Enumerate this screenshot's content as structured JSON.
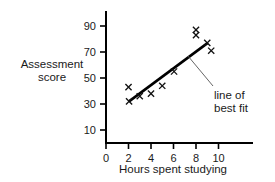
{
  "chart_data": {
    "type": "scatter",
    "title": "",
    "xlabel": "Hours spent studying",
    "ylabel_line1": "Assessment",
    "ylabel_line2": "score",
    "xlim": [
      0,
      11
    ],
    "ylim": [
      0,
      95
    ],
    "xticks": [
      0,
      2,
      4,
      6,
      8,
      10
    ],
    "xtick_labels": [
      "0",
      "2",
      "4",
      "6",
      "8",
      "10"
    ],
    "yticks": [
      10,
      30,
      50,
      70,
      90
    ],
    "ytick_labels": [
      "10",
      "30",
      "50",
      "70",
      "90"
    ],
    "grid": false,
    "legend": "none",
    "marker": "x",
    "points": [
      {
        "x": 2.0,
        "y": 43
      },
      {
        "x": 2.05,
        "y": 32
      },
      {
        "x": 3.0,
        "y": 36
      },
      {
        "x": 4.0,
        "y": 38
      },
      {
        "x": 5.0,
        "y": 44
      },
      {
        "x": 6.05,
        "y": 55
      },
      {
        "x": 8.0,
        "y": 87
      },
      {
        "x": 8.0,
        "y": 83
      },
      {
        "x": 9.0,
        "y": 77
      },
      {
        "x": 9.35,
        "y": 71
      }
    ],
    "trendline": {
      "label_line1": "line of",
      "label_line2": "best fit",
      "x0": 2.05,
      "y0": 32,
      "x1": 9.05,
      "y1": 77
    },
    "colors": {
      "axis": "#000000",
      "marker": "#111111",
      "trendline": "#000000",
      "leader": "#555555",
      "background": "#ffffff",
      "text": "#1a1a1a"
    }
  }
}
